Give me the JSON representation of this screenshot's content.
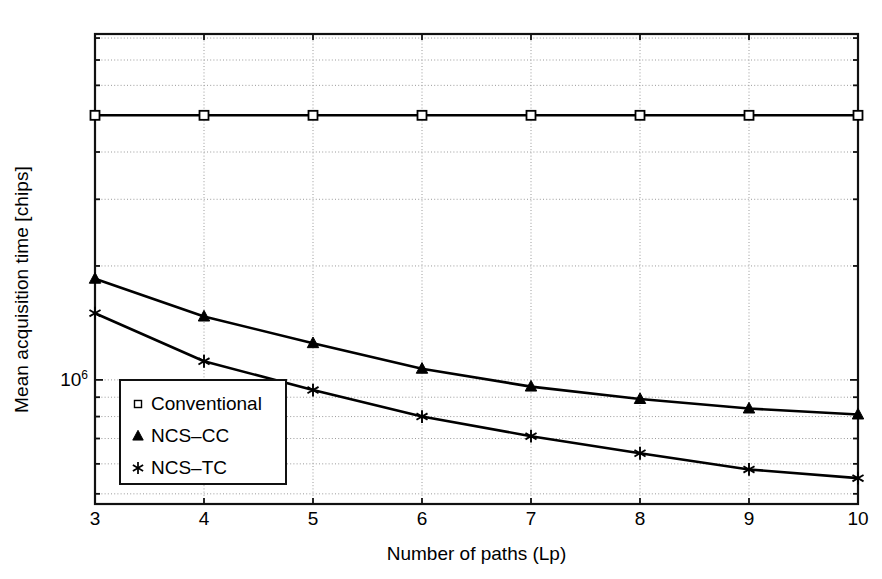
{
  "chart_data": {
    "type": "line",
    "title": "",
    "xlabel": "Number of paths (Lp)",
    "ylabel": "Mean acquisition time [chips]",
    "yscale": "log",
    "xscale": "linear",
    "xlim": [
      3,
      10
    ],
    "ylim": [
      470000,
      8200000
    ],
    "grid": true,
    "grid_style": "dotted",
    "legend_position": "lower-left-inside",
    "x": [
      3,
      4,
      5,
      6,
      7,
      8,
      9,
      10
    ],
    "xticks": [
      "3",
      "4",
      "5",
      "6",
      "7",
      "8",
      "9",
      "10"
    ],
    "yticks": [
      {
        "value": 1000000,
        "label_base": "10",
        "label_exp": "6"
      }
    ],
    "series": [
      {
        "name": "Conventional",
        "marker": "square-open",
        "color": "#000000",
        "values": [
          5000000,
          5000000,
          5000000,
          5000000,
          5000000,
          5000000,
          5000000,
          5000000
        ]
      },
      {
        "name": "NCS–CC",
        "marker": "triangle-filled",
        "color": "#000000",
        "values": [
          1850000,
          1470000,
          1250000,
          1070000,
          960000,
          890000,
          840000,
          810000
        ]
      },
      {
        "name": "NCS–TC",
        "marker": "asterisk",
        "color": "#000000",
        "values": [
          1500000,
          1120000,
          940000,
          800000,
          710000,
          640000,
          580000,
          550000
        ]
      }
    ]
  },
  "legend": {
    "entries": [
      {
        "label": "Conventional",
        "marker": "square-open"
      },
      {
        "label": "NCS–CC",
        "marker": "triangle-filled"
      },
      {
        "label": "NCS–TC",
        "marker": "asterisk"
      }
    ]
  },
  "colors": {
    "axis": "#111111",
    "grid": "#9a9a9a",
    "line": "#000000",
    "background": "#ffffff"
  }
}
